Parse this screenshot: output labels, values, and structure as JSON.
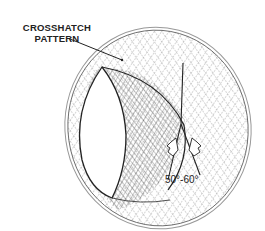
{
  "diagram": {
    "title_label": {
      "line1": "CROSSHATCH",
      "line2": "PATTERN"
    },
    "angle_label": "50°-60°",
    "colors": {
      "ink": "#222222",
      "hatch": "#555555",
      "background": "#ffffff"
    },
    "elements": [
      "cylinder-bore-outline",
      "crosshatch-pattern",
      "leader-line",
      "angle-lines",
      "direction-arrows"
    ]
  }
}
